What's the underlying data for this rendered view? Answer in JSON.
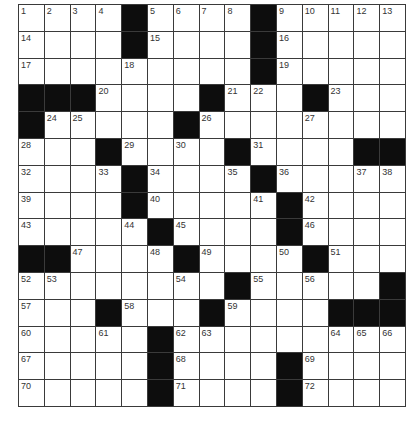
{
  "puzzle": {
    "rows": 15,
    "cols": 15,
    "colors": {
      "block": "#0d0d0d",
      "cell": "#ffffff",
      "line": "#3a3a3a",
      "number": "#333333"
    },
    "grid": [
      [
        "1",
        "2",
        "3",
        "4",
        "#",
        "5",
        "6",
        "7",
        "8",
        "#",
        "9",
        "10",
        "11",
        "12",
        "13"
      ],
      [
        "14",
        ".",
        ".",
        ".",
        "#",
        "15",
        ".",
        ".",
        ".",
        "#",
        "16",
        ".",
        ".",
        ".",
        "."
      ],
      [
        "17",
        ".",
        ".",
        ".",
        "18",
        ".",
        ".",
        ".",
        ".",
        "#",
        "19",
        ".",
        ".",
        ".",
        "."
      ],
      [
        "#",
        "#",
        "#",
        "20",
        ".",
        ".",
        ".",
        "#",
        "21",
        "22",
        ".",
        "#",
        "23",
        ".",
        "."
      ],
      [
        "#",
        "24",
        "25",
        ".",
        ".",
        ".",
        "#",
        "26",
        ".",
        ".",
        ".",
        "27",
        ".",
        ".",
        "."
      ],
      [
        "28",
        ".",
        ".",
        "#",
        "29",
        ".",
        "30",
        ".",
        "#",
        "31",
        ".",
        ".",
        ".",
        "#",
        "#"
      ],
      [
        "32",
        ".",
        ".",
        "33",
        "#",
        "34",
        ".",
        ".",
        "35",
        "#",
        "36",
        ".",
        ".",
        "37",
        "38"
      ],
      [
        "39",
        ".",
        ".",
        ".",
        "#",
        "40",
        ".",
        ".",
        ".",
        "41",
        "#",
        "42",
        ".",
        ".",
        "."
      ],
      [
        "43",
        ".",
        ".",
        ".",
        "44",
        "#",
        "45",
        ".",
        ".",
        ".",
        "#",
        "46",
        ".",
        ".",
        "."
      ],
      [
        "#",
        "#",
        "47",
        ".",
        ".",
        "48",
        "#",
        "49",
        ".",
        ".",
        "50",
        "#",
        "51",
        ".",
        "."
      ],
      [
        "52",
        "53",
        ".",
        ".",
        ".",
        ".",
        "54",
        ".",
        "#",
        "55",
        ".",
        "56",
        ".",
        ".",
        "#"
      ],
      [
        "57",
        ".",
        ".",
        "#",
        "58",
        ".",
        ".",
        "#",
        "59",
        ".",
        ".",
        ".",
        "#",
        "#",
        "#"
      ],
      [
        "60",
        ".",
        ".",
        "61",
        ".",
        "#",
        "62",
        "63",
        ".",
        ".",
        ".",
        ".",
        "64",
        "65",
        "66"
      ],
      [
        "67",
        ".",
        ".",
        ".",
        ".",
        "#",
        "68",
        ".",
        ".",
        ".",
        "#",
        "69",
        ".",
        ".",
        "."
      ],
      [
        "70",
        ".",
        ".",
        ".",
        ".",
        "#",
        "71",
        ".",
        ".",
        ".",
        "#",
        "72",
        ".",
        ".",
        "."
      ]
    ]
  }
}
